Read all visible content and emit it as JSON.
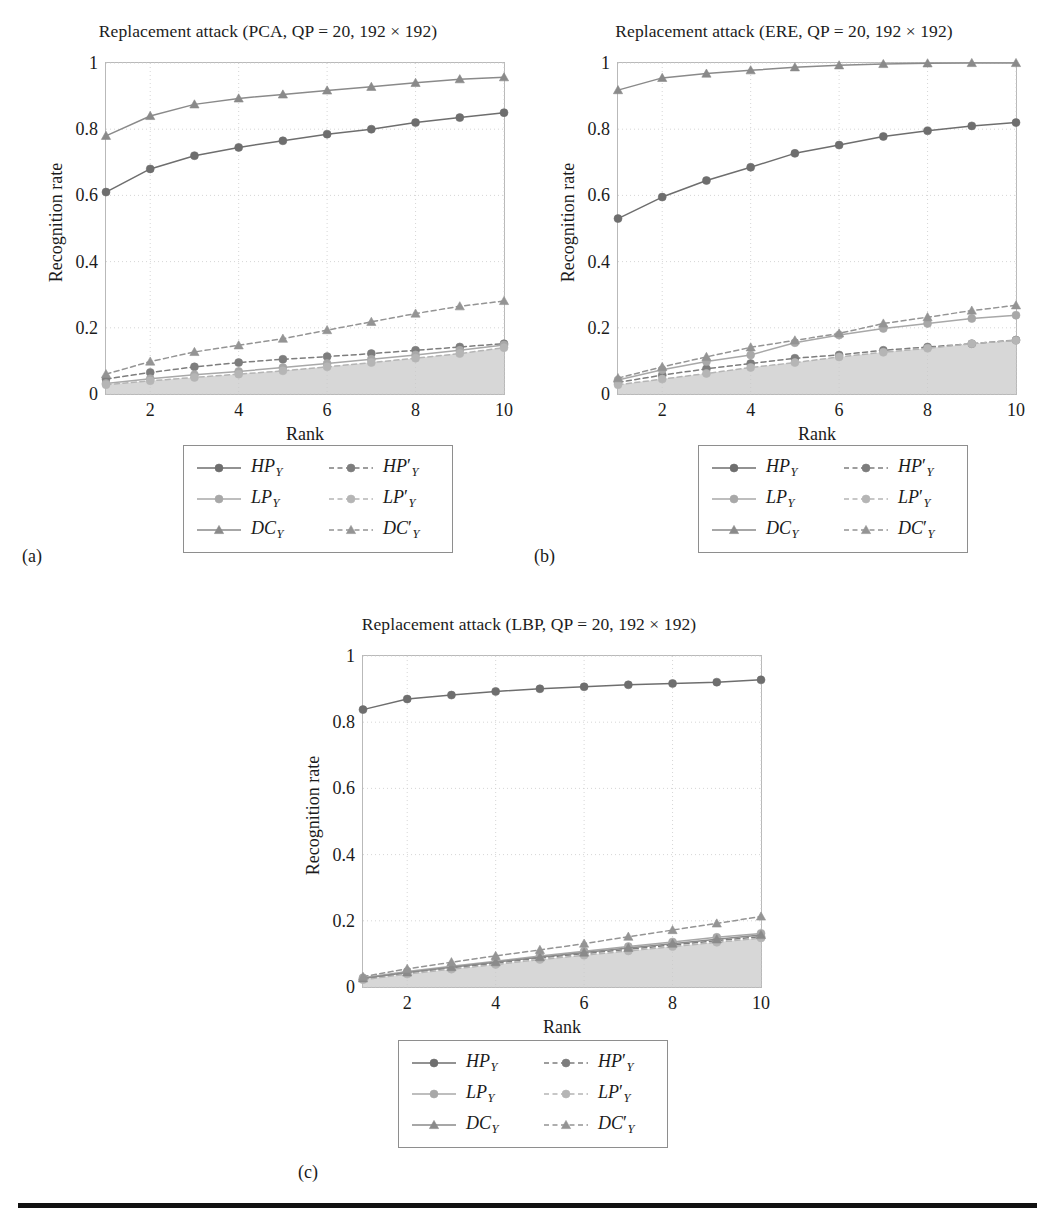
{
  "figure": {
    "axis_label_y": "Recognition rate",
    "axis_label_x": "Rank",
    "subcaptions": {
      "a": "(a)",
      "b": "(b)",
      "c": "(c)"
    },
    "colors": {
      "axis": "#b9b9b9",
      "grid": "#cccccc",
      "text": "#1b1b1b",
      "hp": "#6e6e6e",
      "lp": "#a8a8a8",
      "dc": "#8a8a8a",
      "hp_prime": "#7d7d7d",
      "lp_prime": "#b5b5b5",
      "dc_prime": "#949494",
      "fill": "#c9c9c9",
      "rule": "#111111"
    }
  },
  "legend": {
    "entries": [
      {
        "key": "HP",
        "label": "HP",
        "sub": "Y",
        "prime": false,
        "style": "solid",
        "marker": "circle",
        "color": "#6e6e6e"
      },
      {
        "key": "HPp",
        "label": "HP",
        "sub": "Y",
        "prime": true,
        "style": "dashed",
        "marker": "circle",
        "color": "#7d7d7d"
      },
      {
        "key": "LP",
        "label": "LP",
        "sub": "Y",
        "prime": false,
        "style": "solid",
        "marker": "circle",
        "color": "#a8a8a8"
      },
      {
        "key": "LPp",
        "label": "LP",
        "sub": "Y",
        "prime": true,
        "style": "dashed",
        "marker": "circle",
        "color": "#b5b5b5"
      },
      {
        "key": "DC",
        "label": "DC",
        "sub": "Y",
        "prime": false,
        "style": "solid",
        "marker": "triangle",
        "color": "#8a8a8a"
      },
      {
        "key": "DCp",
        "label": "DC",
        "sub": "Y",
        "prime": true,
        "style": "dashed",
        "marker": "triangle",
        "color": "#949494"
      }
    ]
  },
  "chart_data": [
    {
      "id": "a",
      "type": "line",
      "title": "Replacement attack (PCA, QP = 20, 192 × 192)",
      "xlabel": "Rank",
      "ylabel": "Recognition rate",
      "x": [
        1,
        2,
        3,
        4,
        5,
        6,
        7,
        8,
        9,
        10
      ],
      "xlim": [
        1,
        10
      ],
      "ylim": [
        0,
        1
      ],
      "xticks": [
        2,
        4,
        6,
        8,
        10
      ],
      "yticks": [
        0,
        0.2,
        0.4,
        0.6,
        0.8,
        1
      ],
      "grid": true,
      "legend_position": "below",
      "series": [
        {
          "name": "HP_Y",
          "style": "solid",
          "marker": "circle",
          "color": "#6e6e6e",
          "values": [
            0.61,
            0.68,
            0.72,
            0.745,
            0.765,
            0.785,
            0.8,
            0.82,
            0.835,
            0.85
          ]
        },
        {
          "name": "HP'_Y",
          "style": "dashed",
          "marker": "circle",
          "color": "#7d7d7d",
          "values": [
            0.045,
            0.065,
            0.082,
            0.095,
            0.105,
            0.113,
            0.122,
            0.132,
            0.142,
            0.152
          ]
        },
        {
          "name": "LP_Y",
          "style": "solid",
          "marker": "circle",
          "color": "#a8a8a8",
          "values": [
            0.032,
            0.046,
            0.058,
            0.068,
            0.08,
            0.092,
            0.105,
            0.118,
            0.132,
            0.148
          ]
        },
        {
          "name": "LP'_Y",
          "style": "dashed",
          "marker": "circle",
          "color": "#b5b5b5",
          "values": [
            0.028,
            0.04,
            0.05,
            0.06,
            0.07,
            0.082,
            0.095,
            0.108,
            0.122,
            0.14
          ]
        },
        {
          "name": "DC_Y",
          "style": "solid",
          "marker": "triangle",
          "color": "#8a8a8a",
          "values": [
            0.78,
            0.84,
            0.875,
            0.893,
            0.905,
            0.917,
            0.928,
            0.94,
            0.951,
            0.957
          ]
        },
        {
          "name": "DC'_Y",
          "style": "dashed",
          "marker": "triangle",
          "color": "#949494",
          "values": [
            0.06,
            0.098,
            0.127,
            0.147,
            0.167,
            0.193,
            0.218,
            0.243,
            0.265,
            0.281
          ]
        }
      ]
    },
    {
      "id": "b",
      "type": "line",
      "title": "Replacement attack (ERE, QP = 20, 192 × 192)",
      "xlabel": "Rank",
      "ylabel": "Recognition rate",
      "x": [
        1,
        2,
        3,
        4,
        5,
        6,
        7,
        8,
        9,
        10
      ],
      "xlim": [
        1,
        10
      ],
      "ylim": [
        0,
        1
      ],
      "xticks": [
        2,
        4,
        6,
        8,
        10
      ],
      "yticks": [
        0,
        0.2,
        0.4,
        0.6,
        0.8,
        1
      ],
      "grid": true,
      "legend_position": "below",
      "series": [
        {
          "name": "HP_Y",
          "style": "solid",
          "marker": "circle",
          "color": "#6e6e6e",
          "values": [
            0.53,
            0.595,
            0.645,
            0.685,
            0.727,
            0.752,
            0.778,
            0.795,
            0.81,
            0.82
          ]
        },
        {
          "name": "HP'_Y",
          "style": "dashed",
          "marker": "circle",
          "color": "#7d7d7d",
          "values": [
            0.035,
            0.057,
            0.076,
            0.092,
            0.108,
            0.118,
            0.132,
            0.142,
            0.152,
            0.163
          ]
        },
        {
          "name": "LP_Y",
          "style": "solid",
          "marker": "circle",
          "color": "#a8a8a8",
          "values": [
            0.042,
            0.073,
            0.098,
            0.118,
            0.155,
            0.178,
            0.198,
            0.213,
            0.228,
            0.238
          ]
        },
        {
          "name": "LP'_Y",
          "style": "dashed",
          "marker": "circle",
          "color": "#b5b5b5",
          "values": [
            0.028,
            0.045,
            0.062,
            0.08,
            0.095,
            0.112,
            0.126,
            0.138,
            0.152,
            0.162
          ]
        },
        {
          "name": "DC_Y",
          "style": "solid",
          "marker": "triangle",
          "color": "#8a8a8a",
          "values": [
            0.918,
            0.955,
            0.968,
            0.978,
            0.987,
            0.993,
            0.997,
            0.999,
            1.0,
            1.0
          ]
        },
        {
          "name": "DC'_Y",
          "style": "dashed",
          "marker": "triangle",
          "color": "#949494",
          "values": [
            0.048,
            0.082,
            0.112,
            0.141,
            0.162,
            0.183,
            0.213,
            0.232,
            0.252,
            0.268
          ]
        }
      ]
    },
    {
      "id": "c",
      "type": "line",
      "title": "Replacement attack (LBP, QP = 20, 192 × 192)",
      "xlabel": "Rank",
      "ylabel": "Recognition rate",
      "x": [
        1,
        2,
        3,
        4,
        5,
        6,
        7,
        8,
        9,
        10
      ],
      "xlim": [
        1,
        10
      ],
      "ylim": [
        0,
        1
      ],
      "xticks": [
        2,
        4,
        6,
        8,
        10
      ],
      "yticks": [
        0,
        0.2,
        0.4,
        0.6,
        0.8,
        1
      ],
      "grid": true,
      "legend_position": "below",
      "series": [
        {
          "name": "HP_Y",
          "style": "solid",
          "marker": "circle",
          "color": "#6e6e6e",
          "values": [
            0.838,
            0.87,
            0.882,
            0.893,
            0.901,
            0.907,
            0.913,
            0.917,
            0.921,
            0.928
          ]
        },
        {
          "name": "HP'_Y",
          "style": "dashed",
          "marker": "circle",
          "color": "#7d7d7d",
          "values": [
            0.025,
            0.043,
            0.058,
            0.072,
            0.088,
            0.101,
            0.114,
            0.127,
            0.14,
            0.152
          ]
        },
        {
          "name": "LP_Y",
          "style": "solid",
          "marker": "circle",
          "color": "#a8a8a8",
          "values": [
            0.028,
            0.047,
            0.063,
            0.078,
            0.094,
            0.108,
            0.122,
            0.136,
            0.15,
            0.162
          ]
        },
        {
          "name": "LP'_Y",
          "style": "dashed",
          "marker": "circle",
          "color": "#b5b5b5",
          "values": [
            0.022,
            0.039,
            0.054,
            0.068,
            0.083,
            0.096,
            0.109,
            0.122,
            0.135,
            0.148
          ]
        },
        {
          "name": "DC_Y",
          "style": "solid",
          "marker": "triangle",
          "color": "#8a8a8a",
          "values": [
            0.026,
            0.044,
            0.06,
            0.075,
            0.09,
            0.104,
            0.118,
            0.131,
            0.144,
            0.157
          ]
        },
        {
          "name": "DC'_Y",
          "style": "dashed",
          "marker": "triangle",
          "color": "#949494",
          "values": [
            0.031,
            0.055,
            0.075,
            0.094,
            0.112,
            0.131,
            0.152,
            0.172,
            0.192,
            0.213
          ]
        }
      ]
    }
  ]
}
